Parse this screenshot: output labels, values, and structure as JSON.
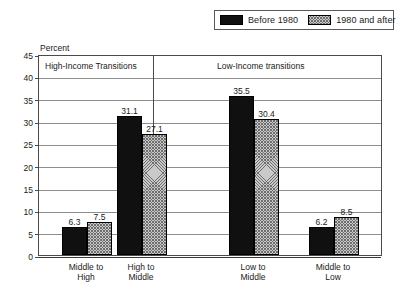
{
  "chart_data": {
    "type": "bar",
    "title": "",
    "ylabel": "Percent",
    "xlabel": "",
    "ylim": [
      0,
      45
    ],
    "ytick_step": 5,
    "yticks": [
      "0",
      "5",
      "10",
      "15",
      "20",
      "25",
      "30",
      "35",
      "40",
      "45"
    ],
    "grid": true,
    "legend_position": "top-right",
    "categories": [
      "Middle to High",
      "High to Middle",
      "Low to Middle",
      "Middle to Low"
    ],
    "category_lines": [
      [
        "Middle to",
        "High"
      ],
      [
        "High to",
        "Middle"
      ],
      [
        "Low to",
        "Middle"
      ],
      [
        "Middle to",
        "Low"
      ]
    ],
    "series": [
      {
        "name": "Before 1980",
        "values": [
          6.3,
          31.1,
          35.5,
          6.2
        ],
        "color": "#101010"
      },
      {
        "name": "1980 and after",
        "values": [
          7.5,
          27.1,
          30.4,
          8.5
        ],
        "color": "#c9c9c9"
      }
    ],
    "panels": [
      {
        "title": "High-Income Transitions",
        "categories": [
          0,
          1
        ]
      },
      {
        "title": "Low-Income transitions",
        "categories": [
          2,
          3
        ]
      }
    ]
  },
  "legend": {
    "entries": [
      {
        "label": "Before 1980",
        "swatch": "solid-swatch"
      },
      {
        "label": "1980 and after",
        "swatch": "hatched-swatch"
      }
    ]
  },
  "axis": {
    "percent_label": "Percent"
  }
}
